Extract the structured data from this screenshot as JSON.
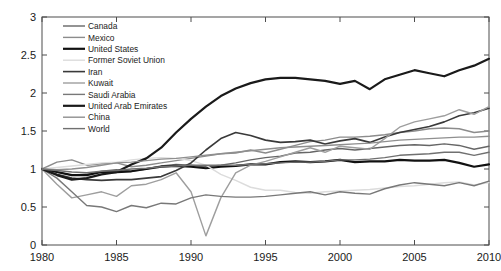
{
  "chart_data": {
    "type": "line",
    "title": "",
    "xlabel": "",
    "ylabel": "Index (1980=1)",
    "xlim": [
      1980,
      2010
    ],
    "ylim": [
      0,
      3
    ],
    "xticks": [
      1980,
      1985,
      1990,
      1995,
      2000,
      2005,
      2010
    ],
    "yticks": [
      0,
      0.5,
      1,
      1.5,
      2,
      2.5,
      3
    ],
    "grid": false,
    "legend_position": "upper-left-inside",
    "x": [
      1980,
      1981,
      1982,
      1983,
      1984,
      1985,
      1986,
      1987,
      1988,
      1989,
      1990,
      1991,
      1992,
      1993,
      1994,
      1995,
      1996,
      1997,
      1998,
      1999,
      2000,
      2001,
      2002,
      2003,
      2004,
      2005,
      2006,
      2007,
      2008,
      2009,
      2010
    ],
    "series": [
      {
        "name": "Canada",
        "color": "#666666",
        "width": 1.4,
        "values": [
          1.0,
          0.96,
          0.92,
          0.93,
          0.97,
          0.99,
          0.97,
          1.0,
          1.04,
          1.06,
          1.05,
          1.03,
          1.05,
          1.08,
          1.12,
          1.15,
          1.17,
          1.21,
          1.22,
          1.25,
          1.27,
          1.25,
          1.27,
          1.29,
          1.31,
          1.32,
          1.31,
          1.33,
          1.31,
          1.26,
          1.3
        ]
      },
      {
        "name": "Mexico",
        "color": "#8c8c8c",
        "width": 1.4,
        "values": [
          1.0,
          1.09,
          1.12,
          1.05,
          1.07,
          1.08,
          1.03,
          1.05,
          1.08,
          1.11,
          1.14,
          1.17,
          1.2,
          1.21,
          1.25,
          1.21,
          1.26,
          1.31,
          1.36,
          1.38,
          1.42,
          1.42,
          1.43,
          1.45,
          1.48,
          1.5,
          1.53,
          1.54,
          1.53,
          1.48,
          1.5
        ]
      },
      {
        "name": "United States",
        "color": "#111111",
        "width": 2.2,
        "values": [
          1.0,
          0.96,
          0.92,
          0.92,
          0.96,
          0.96,
          0.97,
          1.0,
          1.03,
          1.04,
          1.03,
          1.01,
          1.03,
          1.04,
          1.06,
          1.06,
          1.09,
          1.1,
          1.09,
          1.1,
          1.12,
          1.09,
          1.1,
          1.1,
          1.12,
          1.11,
          1.11,
          1.12,
          1.08,
          1.03,
          1.06
        ]
      },
      {
        "name": "Former Soviet Union",
        "color": "#dcdcdc",
        "width": 1.4,
        "values": [
          1.0,
          1.02,
          1.04,
          1.06,
          1.08,
          1.09,
          1.12,
          1.14,
          1.15,
          1.14,
          1.11,
          1.05,
          0.93,
          0.85,
          0.76,
          0.72,
          0.72,
          0.69,
          0.68,
          0.7,
          0.71,
          0.72,
          0.73,
          0.75,
          0.77,
          0.78,
          0.8,
          0.82,
          0.83,
          0.79,
          0.82
        ]
      },
      {
        "name": "Iran",
        "color": "#3a3a3a",
        "width": 1.6,
        "values": [
          1.0,
          0.93,
          0.88,
          0.86,
          0.85,
          0.86,
          0.86,
          0.88,
          0.9,
          0.98,
          1.08,
          1.25,
          1.4,
          1.48,
          1.44,
          1.38,
          1.35,
          1.36,
          1.38,
          1.33,
          1.37,
          1.4,
          1.35,
          1.42,
          1.48,
          1.52,
          1.56,
          1.62,
          1.7,
          1.74,
          1.8
        ]
      },
      {
        "name": "Kuwait",
        "color": "#9e9e9e",
        "width": 1.4,
        "values": [
          1.0,
          0.8,
          0.62,
          0.66,
          0.7,
          0.64,
          0.78,
          0.8,
          0.86,
          0.95,
          0.7,
          0.12,
          0.62,
          0.95,
          1.05,
          1.1,
          1.16,
          1.22,
          1.28,
          1.22,
          1.3,
          1.28,
          1.26,
          1.4,
          1.55,
          1.62,
          1.66,
          1.7,
          1.78,
          1.72,
          1.82
        ]
      },
      {
        "name": "Saudi Arabia",
        "color": "#787878",
        "width": 1.4,
        "values": [
          1.0,
          0.88,
          0.7,
          0.52,
          0.5,
          0.44,
          0.52,
          0.49,
          0.55,
          0.54,
          0.62,
          0.66,
          0.64,
          0.63,
          0.63,
          0.64,
          0.66,
          0.68,
          0.7,
          0.66,
          0.7,
          0.68,
          0.67,
          0.74,
          0.79,
          0.82,
          0.8,
          0.78,
          0.82,
          0.78,
          0.84
        ]
      },
      {
        "name": "United Arab Emirates",
        "color": "#1a1a1a",
        "width": 2.2,
        "values": [
          1.0,
          0.92,
          0.86,
          0.88,
          0.93,
          0.96,
          1.06,
          1.14,
          1.28,
          1.48,
          1.66,
          1.82,
          1.96,
          2.06,
          2.13,
          2.18,
          2.2,
          2.2,
          2.18,
          2.16,
          2.12,
          2.16,
          2.05,
          2.18,
          2.24,
          2.3,
          2.26,
          2.22,
          2.3,
          2.36,
          2.45
        ]
      },
      {
        "name": "China",
        "color": "#8f8f8f",
        "width": 1.4,
        "values": [
          1.0,
          0.99,
          1.0,
          1.02,
          1.05,
          1.08,
          1.09,
          1.11,
          1.13,
          1.14,
          1.16,
          1.18,
          1.2,
          1.22,
          1.24,
          1.26,
          1.28,
          1.29,
          1.3,
          1.31,
          1.32,
          1.33,
          1.34,
          1.36,
          1.38,
          1.39,
          1.4,
          1.41,
          1.42,
          1.42,
          1.43
        ]
      },
      {
        "name": "World",
        "color": "#707070",
        "width": 1.4,
        "values": [
          1.0,
          0.98,
          0.96,
          0.95,
          0.97,
          0.98,
          1.0,
          1.01,
          1.03,
          1.04,
          1.05,
          1.05,
          1.05,
          1.05,
          1.06,
          1.07,
          1.08,
          1.09,
          1.09,
          1.1,
          1.12,
          1.12,
          1.13,
          1.15,
          1.18,
          1.19,
          1.2,
          1.22,
          1.22,
          1.18,
          1.22
        ]
      }
    ]
  },
  "axis": {
    "ylabel": "Index (1980=1)",
    "ytick_labels": [
      "0",
      "0.5",
      "1",
      "1.5",
      "2",
      "2.5",
      "3"
    ],
    "xtick_labels": [
      "1980",
      "1985",
      "1990",
      "1995",
      "2000",
      "2005",
      "2010"
    ]
  },
  "legend": {
    "entries": [
      "Canada",
      "Mexico",
      "United States",
      "Former Soviet Union",
      "Iran",
      "Kuwait",
      "Saudi Arabia",
      "United Arab Emirates",
      "China",
      "World"
    ]
  }
}
